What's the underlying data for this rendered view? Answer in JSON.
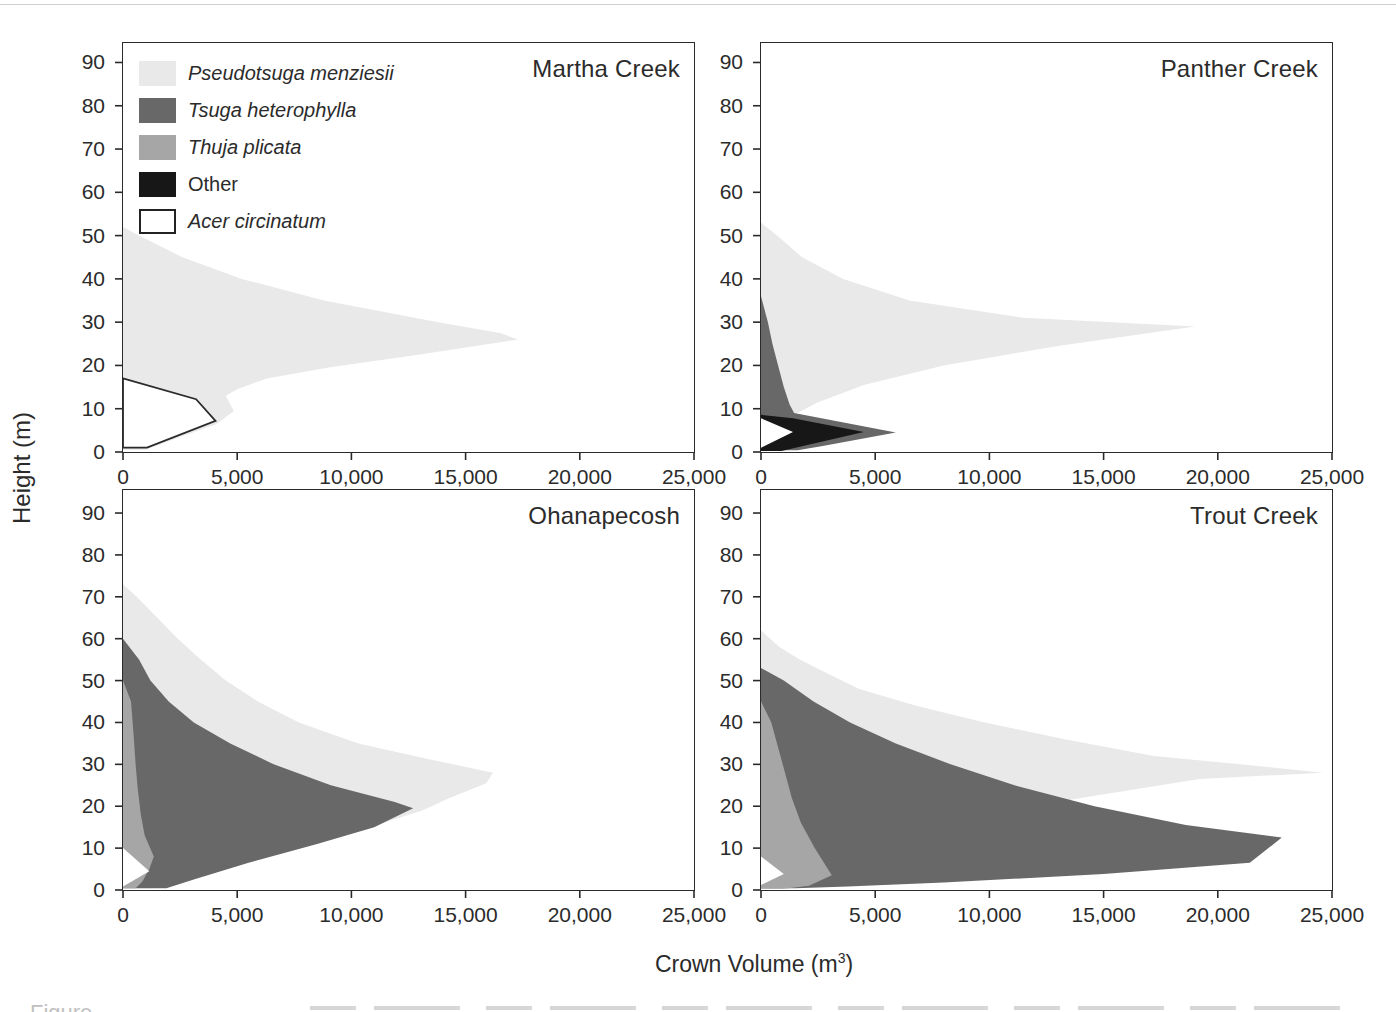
{
  "figure": {
    "xlabel": "Crown Volume (m³)",
    "xlabel_base": "Crown Volume (m",
    "xlabel_sup": "3",
    "xlabel_close": ")",
    "ylabel": "Height (m)",
    "caption_fragment": "Figure"
  },
  "colors": {
    "pseudotsuga": "#e9e9e9",
    "tsuga": "#686868",
    "thuja": "#a6a6a6",
    "other": "#171717",
    "acer": "#ffffff",
    "acer_stroke": "#2b2b2b",
    "frame": "#2a2a2a",
    "text": "#2b2b2b"
  },
  "legend": {
    "entries": [
      {
        "key": "pseudotsuga",
        "label": "Pseudotsuga menziesii",
        "italic": true
      },
      {
        "key": "tsuga",
        "label": "Tsuga heterophylla",
        "italic": true
      },
      {
        "key": "thuja",
        "label": "Thuja plicata",
        "italic": true
      },
      {
        "key": "other",
        "label": "Other",
        "italic": false
      },
      {
        "key": "acer",
        "label": "Acer circinatum",
        "italic": true
      }
    ]
  },
  "axes": {
    "xmax": 25000,
    "x_ticks": [
      {
        "value": 0,
        "label": "0"
      },
      {
        "value": 5000,
        "label": "5,000"
      },
      {
        "value": 10000,
        "label": "10,000"
      },
      {
        "value": 15000,
        "label": "15,000"
      },
      {
        "value": 20000,
        "label": "20,000"
      },
      {
        "value": 25000,
        "label": "25,000"
      }
    ],
    "y_ticks": [
      {
        "value": 90,
        "label": "90"
      },
      {
        "value": 80,
        "label": "80"
      },
      {
        "value": 70,
        "label": "70"
      },
      {
        "value": 60,
        "label": "60"
      },
      {
        "value": 50,
        "label": "50"
      },
      {
        "value": 40,
        "label": "40"
      },
      {
        "value": 30,
        "label": "30"
      },
      {
        "value": 20,
        "label": "20"
      },
      {
        "value": 10,
        "label": "10"
      },
      {
        "value": 0,
        "label": "0"
      }
    ]
  },
  "chart_data": [
    {
      "type": "area",
      "title": "Martha Creek",
      "xlabel": "Crown Volume (m3)",
      "ylabel": "Height (m)",
      "xlim": [
        0,
        25000
      ],
      "ylim": [
        0,
        90
      ],
      "series": [
        {
          "key": "pseudotsuga",
          "name": "Pseudotsuga menziesii",
          "points": [
            [
              0,
              52
            ],
            [
              700,
              50
            ],
            [
              2600,
              45
            ],
            [
              5200,
              40
            ],
            [
              8800,
              35
            ],
            [
              13800,
              30
            ],
            [
              16500,
              27.5
            ],
            [
              17300,
              26
            ],
            [
              13000,
              22.5
            ],
            [
              9000,
              19.5
            ],
            [
              6300,
              17
            ],
            [
              5000,
              14.5
            ],
            [
              4500,
              13
            ],
            [
              4850,
              9.5
            ],
            [
              4100,
              6.5
            ],
            [
              2500,
              3.5
            ],
            [
              1000,
              0.5
            ],
            [
              0,
              0.5
            ]
          ]
        },
        {
          "key": "acer",
          "name": "Acer circinatum",
          "outlined": true,
          "points": [
            [
              0,
              17
            ],
            [
              3200,
              12.2
            ],
            [
              4050,
              7.2
            ],
            [
              1050,
              1
            ],
            [
              0,
              1
            ]
          ]
        }
      ]
    },
    {
      "type": "area",
      "title": "Panther Creek",
      "xlabel": "Crown Volume (m3)",
      "ylabel": "Height (m)",
      "xlim": [
        0,
        25000
      ],
      "ylim": [
        0,
        90
      ],
      "series": [
        {
          "key": "pseudotsuga",
          "name": "Pseudotsuga menziesii",
          "points": [
            [
              0,
              53
            ],
            [
              700,
              50
            ],
            [
              1800,
              45
            ],
            [
              3600,
              40
            ],
            [
              6500,
              35
            ],
            [
              11500,
              31
            ],
            [
              19000,
              29
            ],
            [
              13000,
              24.5
            ],
            [
              8000,
              20
            ],
            [
              4500,
              15.5
            ],
            [
              2500,
              11.5
            ],
            [
              1400,
              8.5
            ],
            [
              0,
              8.5
            ]
          ]
        },
        {
          "key": "tsuga",
          "name": "Tsuga heterophylla",
          "points": [
            [
              0,
              36
            ],
            [
              300,
              30
            ],
            [
              500,
              25
            ],
            [
              750,
              20
            ],
            [
              1000,
              15
            ],
            [
              1250,
              11
            ],
            [
              1450,
              9
            ],
            [
              5900,
              4.5
            ],
            [
              2700,
              1.4
            ],
            [
              1600,
              0.4
            ],
            [
              0,
              0.4
            ]
          ]
        },
        {
          "key": "other",
          "name": "Other",
          "points": [
            [
              0,
              8.6
            ],
            [
              1400,
              7.8
            ],
            [
              4500,
              4.6
            ],
            [
              1700,
              1.2
            ],
            [
              900,
              0.2
            ],
            [
              0,
              0.2
            ]
          ]
        },
        {
          "key": "acer",
          "name": "Acer circinatum",
          "points": [
            [
              0,
              7.8
            ],
            [
              1400,
              4.6
            ],
            [
              0,
              1.0
            ]
          ]
        }
      ]
    },
    {
      "type": "area",
      "title": "Ohanapecosh",
      "xlabel": "Crown Volume (m3)",
      "ylabel": "Height (m)",
      "xlim": [
        0,
        25000
      ],
      "ylim": [
        0,
        90
      ],
      "series": [
        {
          "key": "pseudotsuga",
          "name": "Pseudotsuga menziesii",
          "points": [
            [
              0,
              73
            ],
            [
              600,
              70
            ],
            [
              1500,
              65
            ],
            [
              2400,
              60
            ],
            [
              3400,
              55
            ],
            [
              4500,
              50
            ],
            [
              5900,
              45
            ],
            [
              7700,
              40
            ],
            [
              10300,
              35
            ],
            [
              13600,
              31
            ],
            [
              16200,
              28
            ],
            [
              15900,
              25.5
            ],
            [
              14300,
              22
            ],
            [
              13100,
              19
            ],
            [
              10800,
              15
            ],
            [
              7500,
              11
            ],
            [
              4200,
              7
            ],
            [
              2200,
              3
            ],
            [
              1300,
              0.4
            ],
            [
              0,
              0.4
            ]
          ]
        },
        {
          "key": "tsuga",
          "name": "Tsuga heterophylla",
          "points": [
            [
              0,
              60
            ],
            [
              700,
              55
            ],
            [
              1200,
              50
            ],
            [
              2000,
              45
            ],
            [
              3100,
              40
            ],
            [
              4700,
              35
            ],
            [
              6600,
              30
            ],
            [
              9100,
              25
            ],
            [
              11900,
              21
            ],
            [
              12700,
              19.5
            ],
            [
              11000,
              15
            ],
            [
              8500,
              11
            ],
            [
              5500,
              6.5
            ],
            [
              3100,
              2.5
            ],
            [
              1900,
              0.4
            ],
            [
              0,
              0.4
            ]
          ]
        },
        {
          "key": "thuja",
          "name": "Thuja plicata",
          "points": [
            [
              0,
              50
            ],
            [
              350,
              45
            ],
            [
              450,
              38
            ],
            [
              550,
              30
            ],
            [
              650,
              24
            ],
            [
              780,
              18
            ],
            [
              950,
              13
            ],
            [
              1350,
              8
            ],
            [
              1150,
              5
            ],
            [
              850,
              2
            ],
            [
              550,
              0.4
            ],
            [
              0,
              0.4
            ]
          ]
        },
        {
          "key": "acer",
          "name": "Acer circinatum",
          "points": [
            [
              0,
              10
            ],
            [
              1150,
              4.5
            ],
            [
              0,
              0.8
            ]
          ]
        }
      ]
    },
    {
      "type": "area",
      "title": "Trout Creek",
      "xlabel": "Crown Volume (m3)",
      "ylabel": "Height (m)",
      "xlim": [
        0,
        25000
      ],
      "ylim": [
        0,
        90
      ],
      "series": [
        {
          "key": "pseudotsuga",
          "name": "Pseudotsuga menziesii",
          "points": [
            [
              0,
              62
            ],
            [
              800,
              58
            ],
            [
              1700,
              55
            ],
            [
              2800,
              52
            ],
            [
              4300,
              48
            ],
            [
              6800,
              44
            ],
            [
              9800,
              40
            ],
            [
              13300,
              36
            ],
            [
              17200,
              32
            ],
            [
              21000,
              30
            ],
            [
              24600,
              28
            ],
            [
              19200,
              26.5
            ],
            [
              14000,
              22
            ],
            [
              9000,
              17
            ],
            [
              5500,
              12.5
            ],
            [
              3200,
              8.5
            ],
            [
              1600,
              3
            ],
            [
              900,
              0.4
            ],
            [
              0,
              0.4
            ]
          ]
        },
        {
          "key": "tsuga",
          "name": "Tsuga heterophylla",
          "points": [
            [
              0,
              53
            ],
            [
              1000,
              50
            ],
            [
              2300,
              45
            ],
            [
              3900,
              40
            ],
            [
              5900,
              35
            ],
            [
              8300,
              30
            ],
            [
              11100,
              25
            ],
            [
              14600,
              20
            ],
            [
              18600,
              15.5
            ],
            [
              22800,
              12.5
            ],
            [
              21400,
              6.5
            ],
            [
              15000,
              3.8
            ],
            [
              8000,
              1.8
            ],
            [
              3800,
              0.8
            ],
            [
              1500,
              0.4
            ],
            [
              0,
              0.4
            ]
          ]
        },
        {
          "key": "thuja",
          "name": "Thuja plicata",
          "points": [
            [
              0,
              45
            ],
            [
              450,
              40
            ],
            [
              750,
              34
            ],
            [
              1050,
              28
            ],
            [
              1350,
              22
            ],
            [
              1750,
              16
            ],
            [
              2350,
              10
            ],
            [
              3100,
              3.5
            ],
            [
              2100,
              1
            ],
            [
              1000,
              0.3
            ],
            [
              0,
              0.3
            ]
          ]
        },
        {
          "key": "acer",
          "name": "Acer circinatum",
          "points": [
            [
              0,
              8
            ],
            [
              1000,
              3.8
            ],
            [
              0,
              1.2
            ]
          ]
        }
      ]
    }
  ]
}
